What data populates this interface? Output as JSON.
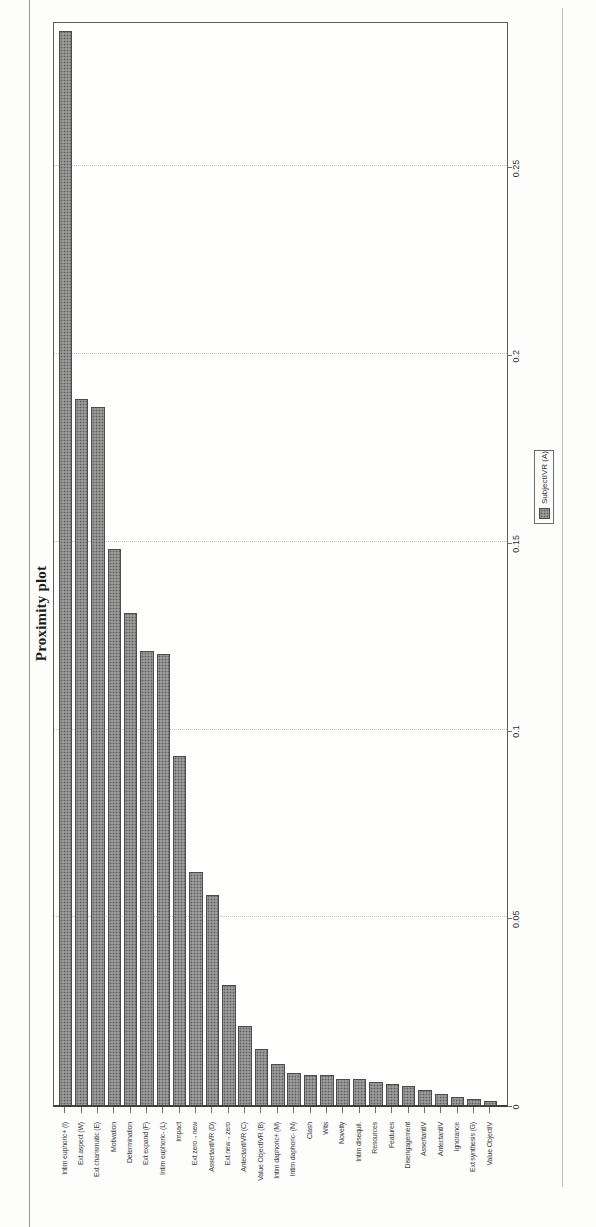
{
  "figure": {
    "kind": "scanned page with bar chart rotated 90 degrees counterclockwise",
    "title": "Proximity plot",
    "legend": {
      "label": "SubjectIVR (A)"
    }
  },
  "chart_data": {
    "type": "bar",
    "orientation": "horizontal",
    "rotated_90_ccw": true,
    "title": "Proximity plot",
    "legend": [
      "SubjectIVR (A)"
    ],
    "categories": [
      "Intim euphoric+ (I)",
      "Ext aspect (W)",
      "Ext charismatic (E)",
      "Motivation",
      "Determination",
      "Ext expand (F)",
      "Intim euphoric- (L)",
      "Impact",
      "Ext zero→new",
      "AssertantIVR (D)",
      "Ext new→zero",
      "AntectantIVR (C)",
      "Value ObjectIVR (B)",
      "Intim daphoric+ (M)",
      "Intim daphoric- (N)",
      "Clash",
      "Wits",
      "Novelty",
      "Intim disequil.",
      "Resources",
      "Features",
      "Disengagement",
      "AssertantIV",
      "AntectantIV",
      "Ignorance",
      "Ext synthesis (G)",
      "Value ObjectIV"
    ],
    "values": [
      0.286,
      0.188,
      0.186,
      0.148,
      0.131,
      0.121,
      0.12,
      0.093,
      0.062,
      0.056,
      0.032,
      0.021,
      0.015,
      0.011,
      0.0085,
      0.008,
      0.008,
      0.007,
      0.007,
      0.006,
      0.0055,
      0.005,
      0.004,
      0.003,
      0.002,
      0.0015,
      0.001
    ],
    "xlabel": "",
    "ylabel": "",
    "xlim": [
      0,
      0.289
    ],
    "tick_labels": [
      "0",
      "0.05",
      "0.1",
      "0.15",
      "0.2",
      "0.25"
    ],
    "tick_values": [
      0,
      0.05,
      0.1,
      0.15,
      0.2,
      0.25
    ],
    "grid": "dotted value gridlines every 0.05",
    "legend_position": "below axis, right of center",
    "bar_color": "#9b9b9b",
    "bar_border_color": "#4c4c4c"
  }
}
